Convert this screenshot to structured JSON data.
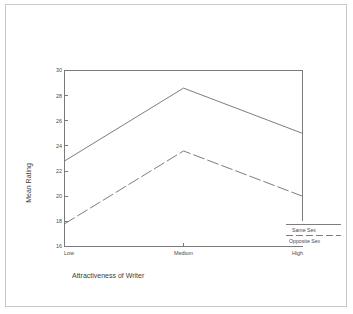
{
  "page": {
    "background_color": "#ffffff",
    "border_color": "#c8c8c8"
  },
  "chart_data": {
    "type": "line",
    "title": "",
    "xlabel": "Attractiveness of Writer",
    "ylabel": "Mean Rating",
    "categories": [
      "Low",
      "Medium",
      "High"
    ],
    "ylim": [
      16,
      30
    ],
    "yticks": [
      16,
      18,
      20,
      22,
      24,
      26,
      28,
      30
    ],
    "ytick_labels": [
      "16",
      "18",
      "20",
      "22",
      "24",
      "26",
      "28",
      "30"
    ],
    "grid": false,
    "legend_position": "bottom-right",
    "series": [
      {
        "name": "Same Sex",
        "style": "solid",
        "color": "#7d7d7d",
        "values": [
          22.8,
          28.6,
          25.0
        ]
      },
      {
        "name": "Opposite Sex",
        "style": "dashed",
        "color": "#7d7d7d",
        "values": [
          17.8,
          23.6,
          20.0
        ]
      }
    ]
  },
  "axis": {
    "ytick_0": "16",
    "ytick_1": "18",
    "ytick_2": "20",
    "ytick_3": "22",
    "ytick_4": "24",
    "ytick_5": "26",
    "ytick_6": "28",
    "ytick_7": "30",
    "xcat_0": "Low",
    "xcat_1": "Medium",
    "xcat_2": "High",
    "x_title": "Attractiveness of Writer",
    "y_title": "Mean Rating"
  },
  "legend": {
    "item_0_label": "Same Sex",
    "item_1_label": "Opposite Sex"
  }
}
